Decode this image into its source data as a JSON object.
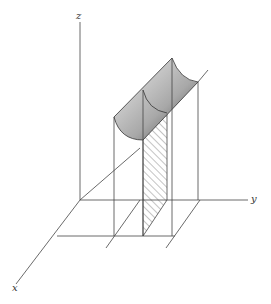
{
  "diagram": {
    "axes": {
      "x_label": "x",
      "y_label": "y",
      "z_label": "z"
    }
  }
}
